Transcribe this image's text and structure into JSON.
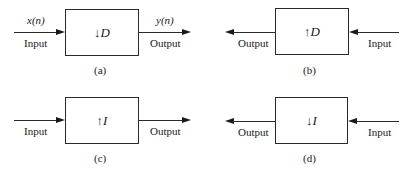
{
  "diagrams": [
    {
      "id": "a",
      "caption": "(a)",
      "operator_symbol": "↓",
      "operator_var": "D",
      "direction": "left-to-right",
      "input_label": "Input",
      "output_label": "Output",
      "input_signal": "x(n)",
      "output_signal": "y(n)"
    },
    {
      "id": "b",
      "caption": "(b)",
      "operator_symbol": "↑",
      "operator_var": "D",
      "direction": "right-to-left",
      "input_label": "Input",
      "output_label": "Output"
    },
    {
      "id": "c",
      "caption": "(c)",
      "operator_symbol": "↑",
      "operator_var": "I",
      "direction": "left-to-right",
      "input_label": "Input",
      "output_label": "Output"
    },
    {
      "id": "d",
      "caption": "(d)",
      "operator_symbol": "↓",
      "operator_var": "I",
      "direction": "right-to-left",
      "input_label": "Input",
      "output_label": "Output"
    }
  ]
}
